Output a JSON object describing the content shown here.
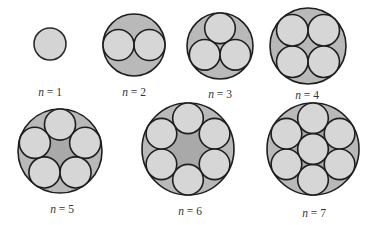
{
  "colors": {
    "outer_fill": "#b9b9b9",
    "inner_fill": "#d6d6d6",
    "stroke": "#1e1e1e",
    "label": "#333333"
  },
  "figures": [
    {
      "n": 1,
      "label_var": "n",
      "label_eq": " = ",
      "label_value": "1",
      "arrangement": "single"
    },
    {
      "n": 2,
      "label_var": "n",
      "label_eq": " = ",
      "label_value": "2",
      "arrangement": "ring"
    },
    {
      "n": 3,
      "label_var": "n",
      "label_eq": " = ",
      "label_value": "3",
      "arrangement": "ring"
    },
    {
      "n": 4,
      "label_var": "n",
      "label_eq": " = ",
      "label_value": "4",
      "arrangement": "ring"
    },
    {
      "n": 5,
      "label_var": "n",
      "label_eq": " = ",
      "label_value": "5",
      "arrangement": "ring"
    },
    {
      "n": 6,
      "label_var": "n",
      "label_eq": " = ",
      "label_value": "6",
      "arrangement": "ring"
    },
    {
      "n": 7,
      "label_var": "n",
      "label_eq": " = ",
      "label_value": "7",
      "arrangement": "ring-plus-center"
    }
  ]
}
